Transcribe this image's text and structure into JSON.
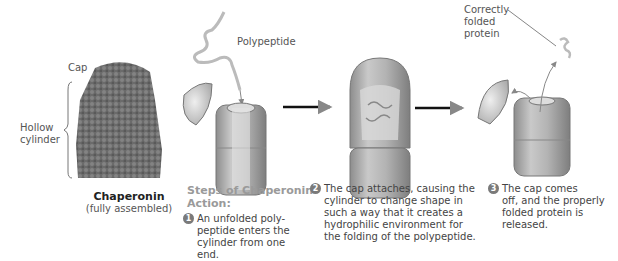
{
  "figure": {
    "assembled": {
      "cap_label": "Cap",
      "cylinder_label_line1": "Hollow",
      "cylinder_label_line2": "cylinder",
      "title": "Chaperonin",
      "subtitle": "(fully assembled)"
    },
    "labels": {
      "polypeptide": "Polypeptide",
      "folded_line1": "Correctly",
      "folded_line2": "folded",
      "folded_line3": "protein"
    },
    "steps_heading_line1": "Steps of Chaperonin",
    "steps_heading_line2": "Action:",
    "steps": [
      {
        "num": "1",
        "lines": [
          "An unfolded poly-",
          "peptide enters the",
          "cylinder from one end."
        ]
      },
      {
        "num": "2",
        "lines": [
          "The cap attaches, causing the",
          "cylinder to change shape in",
          "such a way that it creates a",
          "hydrophilic environment for",
          "the folding of the polypeptide."
        ]
      },
      {
        "num": "3",
        "lines": [
          "The cap comes",
          "off, and the properly",
          "folded protein is",
          "released."
        ]
      }
    ],
    "colors": {
      "heading": "#9a9a9a",
      "step_circle": "#7a7a7a",
      "arrow": "#111111"
    }
  }
}
